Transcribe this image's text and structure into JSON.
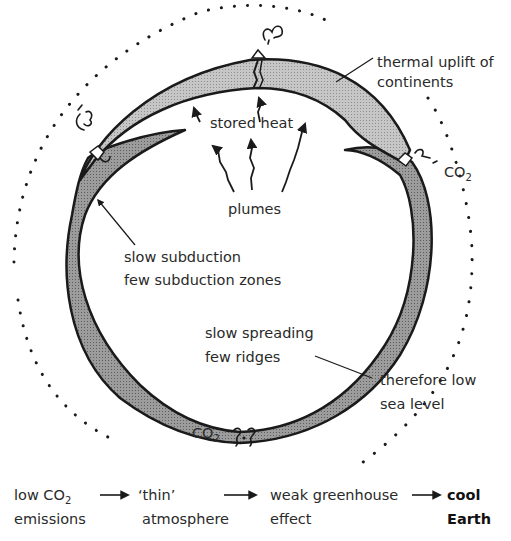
{
  "diagram": {
    "colors": {
      "background": "#ffffff",
      "continental_crust": "#c4c4c4",
      "oceanic_plate": "#9a9a9a",
      "outline": "#1a1a1a",
      "text": "#2a2a2a",
      "atmosphere_dots": "#1a1a1a"
    },
    "labels": {
      "thermal_uplift_line1": "thermal uplift of",
      "thermal_uplift_line2": "continents",
      "stored_heat": "stored heat",
      "plumes": "plumes",
      "co2_right": "CO",
      "co2_right_sub": "2",
      "slow_subduction_line1": "slow subduction",
      "slow_subduction_line2": "few subduction zones",
      "slow_spreading_line1": "slow spreading",
      "slow_spreading_line2": "few ridges",
      "sea_level_line1": "therefore low",
      "sea_level_line2": "sea level",
      "co2_bottom": "CO",
      "co2_bottom_sub": "2"
    },
    "icons": {
      "volcano_top": "volcanic-eruption-icon",
      "volcano_left": "volcanic-eruption-icon",
      "volcano_right": "volcanic-eruption-icon",
      "gas_bottom": "gas-bubble-icon",
      "atmosphere": "dotted-atmosphere-boundary"
    }
  },
  "flow": {
    "steps": [
      {
        "line1": "low CO",
        "line1_sub": "2",
        "line2": "emissions"
      },
      {
        "line1": "‘thin’",
        "line2": "atmosphere"
      },
      {
        "line1": "weak greenhouse",
        "line2": "effect"
      },
      {
        "line1": "cool",
        "line2": "Earth",
        "bold": true
      }
    ]
  }
}
